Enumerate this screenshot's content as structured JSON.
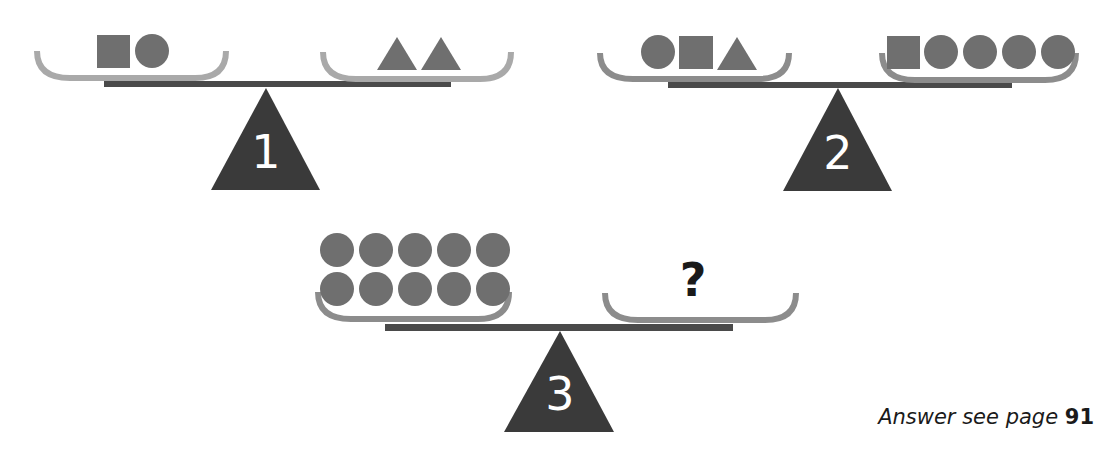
{
  "puzzle": {
    "scales": [
      {
        "label": "1",
        "left_pan": [
          "square",
          "circle"
        ],
        "right_pan": [
          "triangle",
          "triangle"
        ],
        "state": "balanced"
      },
      {
        "label": "2",
        "left_pan": [
          "circle",
          "square",
          "triangle"
        ],
        "right_pan": [
          "square",
          "circle",
          "circle",
          "circle",
          "circle"
        ],
        "state": "balanced"
      },
      {
        "label": "3",
        "left_pan": [
          "circle",
          "circle",
          "circle",
          "circle",
          "circle",
          "circle",
          "circle",
          "circle",
          "circle",
          "circle"
        ],
        "right_pan_label": "?",
        "state": "balanced"
      }
    ]
  },
  "footer": {
    "answer_prefix": "Answer see page ",
    "answer_page": "91"
  },
  "colors": {
    "pan_light": "#a9a9a9",
    "pan": "#8c8c8c",
    "shape": "#6f6f6f",
    "beam": "#4a4a4a",
    "fulcrum": "#3a3a3a"
  }
}
